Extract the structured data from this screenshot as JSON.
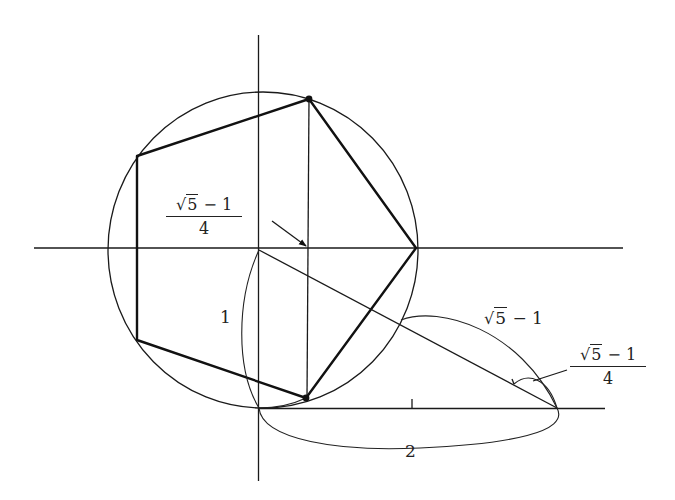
{
  "diagram": {
    "colors": {
      "line": "#1a1a1a",
      "background": "#ffffff"
    },
    "labels": {
      "top_fraction": {
        "numerator_radical": "√",
        "numerator_radicand": "5",
        "numerator_rest": " − 1",
        "denominator": "4"
      },
      "hypotenuse_segment": {
        "radical": "√",
        "radicand": "5",
        "rest": " − 1"
      },
      "right_fraction": {
        "numerator_radical": "√",
        "numerator_radicand": "5",
        "numerator_rest": " − 1",
        "denominator": "4"
      },
      "vertical_leg": "1",
      "horizontal_leg": "2"
    },
    "elements": [
      "x-axis",
      "y-axis",
      "unit-circle",
      "regular-pentagon",
      "vertical-chord",
      "hypotenuse",
      "bottom-baseline",
      "midpoint-tick",
      "vertex-dots",
      "arrow-pointer",
      "brace-arcs"
    ]
  }
}
